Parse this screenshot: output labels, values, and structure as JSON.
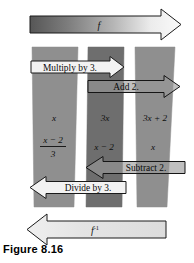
{
  "figure": {
    "caption": "Figure 8.16",
    "forward_arrow_label": "f",
    "inverse_arrow_label": "f",
    "inverse_arrow_exponent": "-1",
    "colors": {
      "band_outer": "#8f8f8f",
      "band_middle": "#6e6e6e",
      "arrow_white": "#f2f2f2",
      "arrow_shaded": "#9a9a9a",
      "outline": "#1a1a1a",
      "background": "#ffffff",
      "gradient_dark": "#5a5a5a",
      "gradient_light": "#f5f5f5"
    },
    "columns": [
      {
        "name": "left-column",
        "top_expression": "x",
        "bottom_numerator": "x − 2",
        "bottom_denominator": "3"
      },
      {
        "name": "middle-column",
        "top_expression": "3x",
        "bottom_expression": "x − 2"
      },
      {
        "name": "right-column",
        "top_expression": "3x + 2",
        "bottom_expression": "x"
      }
    ],
    "operations": [
      {
        "name": "multiply-by-3",
        "label": "Multiply by 3.",
        "direction": "right",
        "fill": "white"
      },
      {
        "name": "add-2",
        "label": "Add 2.",
        "direction": "right",
        "fill": "shaded"
      },
      {
        "name": "subtract-2",
        "label": "Subtract 2.",
        "direction": "left",
        "fill": "shaded"
      },
      {
        "name": "divide-by-3",
        "label": "Divide by 3.",
        "direction": "left",
        "fill": "white"
      }
    ]
  }
}
